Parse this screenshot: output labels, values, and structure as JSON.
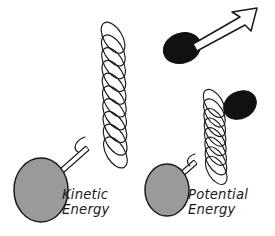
{
  "figure": {
    "background_color": "#ffffff",
    "ink_color": "#1a1a1a",
    "mass_gray_color": "#9a9a9a",
    "bob_black_color": "#111111"
  },
  "systems": [
    {
      "id": "kinetic",
      "label_line1": "Kinetic",
      "label_line2": "Energy",
      "state": "extended",
      "spring_coils": 10,
      "spring_compression": "stretched",
      "has_motion_arrow": true,
      "arrow_direction": "up-right"
    },
    {
      "id": "potential",
      "label_line1": "Potential",
      "label_line2": "Energy",
      "state": "compressed",
      "spring_coils": 8,
      "spring_compression": "compressed",
      "has_motion_arrow": false,
      "arrow_direction": ""
    }
  ],
  "icons": {
    "gray_mass": "gray-ellipse-mass-icon",
    "black_bob": "black-ellipse-bob-icon",
    "spring": "helical-spring-icon",
    "rod": "connecting-rod-icon",
    "arrow": "motion-arrow-icon"
  }
}
